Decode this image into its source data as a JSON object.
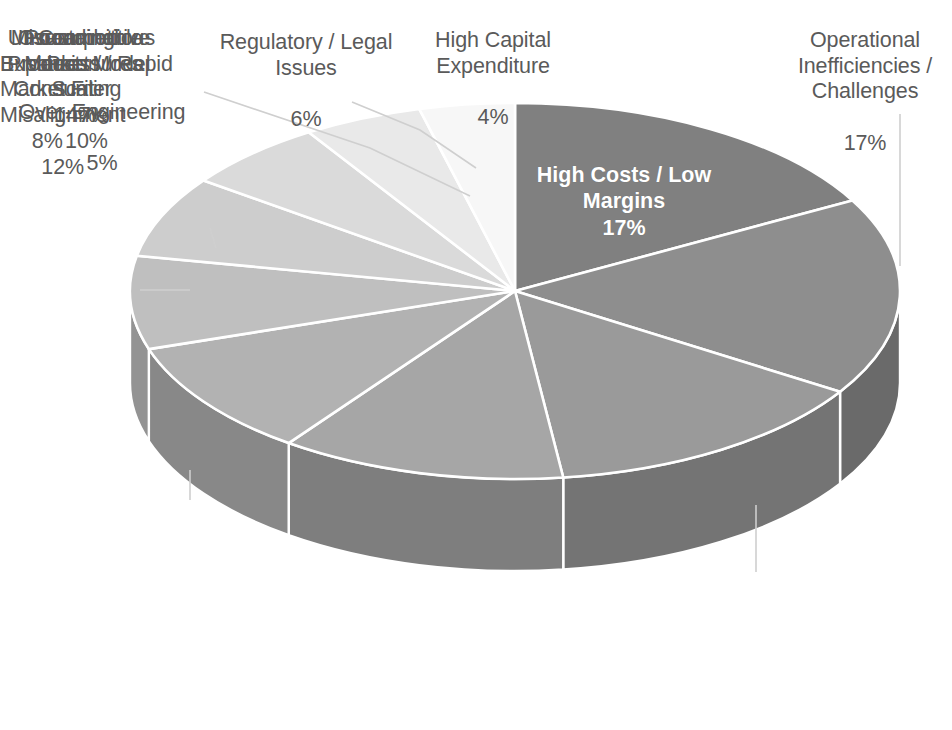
{
  "chart_data": {
    "type": "pie",
    "title": "",
    "subtitle": "",
    "style": "3d-exploded-none",
    "legend_position": "none",
    "label_format": "category + percentage",
    "total_percent": 100,
    "categories": [
      "High Costs / Low Margins",
      "Operational Inefficiencies / Challenges",
      "Unsustainable Business Model",
      "Misreading Market / Consumer Misalignment",
      "Overambitious Expansion / Rapid Scaling",
      "Poor Product-Market Fit",
      "Competitive Pressures",
      "Regulatory / Legal Issues",
      "Over-Engineering",
      "High Capital Expenditure"
    ],
    "values": [
      17,
      17,
      14,
      12,
      10,
      8,
      7,
      6,
      5,
      4
    ],
    "value_labels": [
      "17%",
      "17%",
      "14%",
      "12%",
      "10%",
      "8%",
      "7%",
      "6%",
      "5%",
      "4%"
    ],
    "colors": [
      "#808080",
      "#8e8e8e",
      "#9a9a9a",
      "#a6a6a6",
      "#b2b2b2",
      "#bfbfbf",
      "#cdcdcd",
      "#dadada",
      "#e9e9e9",
      "#f7f7f7"
    ],
    "side_colors": [
      "#5e5e5e",
      "#6a6a6a",
      "#747474",
      "#7e7e7e",
      "#888888",
      "#939393",
      "#9e9e9e",
      "#aaaaaa",
      "#b6b6b6",
      "#c2c2c2"
    ],
    "slice_border_color": "#ffffff",
    "label_text_color": "#5a5a5a",
    "inner_label_text_color": "#ffffff",
    "leader_line_color": "#c8c8c8",
    "background_color": "#ffffff"
  },
  "labels": {
    "high_costs": {
      "category": "High Costs / Low\nMargins",
      "pct": "17%"
    },
    "operational": {
      "category": "Operational\nInefficiencies /\nChallenges",
      "pct": "17%"
    },
    "unsustainable": {
      "category": "Unsustainable\nBusiness Model",
      "pct": "14%"
    },
    "misreading": {
      "category": "Misreading\nMarket /\nConsumer\nMisalignment",
      "pct": "12%"
    },
    "overambitious": {
      "category": "Overambitious\nExpansion / Rapid\nScaling",
      "pct": "10%"
    },
    "poor_pmf": {
      "category": "Poor\nProduct-\nMarket Fit",
      "pct": "8%"
    },
    "competitive": {
      "category": "Competitive\nPressures",
      "pct": "7%"
    },
    "regulatory": {
      "category": "Regulatory / Legal\nIssues",
      "pct": "6%"
    },
    "over_engineering": {
      "category": "Over-Engineering",
      "pct": "5%"
    },
    "high_capital": {
      "category": "High Capital\nExpenditure",
      "pct": "4%"
    }
  }
}
